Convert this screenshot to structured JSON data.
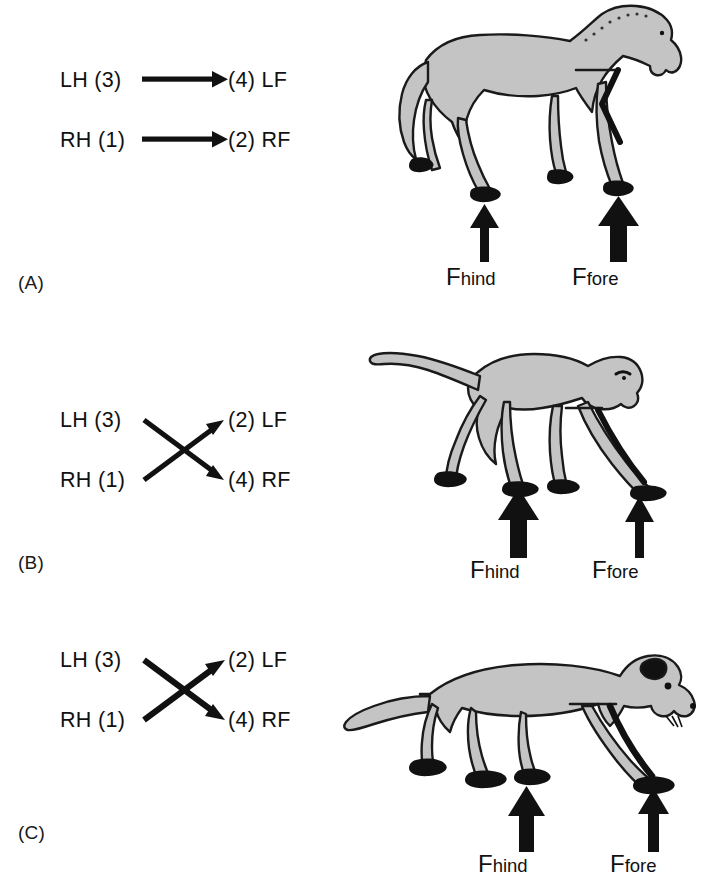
{
  "figure": {
    "background": "#ffffff",
    "ink": "#111111",
    "body_fill": "#c4c4c4",
    "body_stroke": "#1a1a1a",
    "hoof_fill": "#111111"
  },
  "panels": [
    {
      "letter": "(A)",
      "animal": "horse",
      "pattern": "parallel",
      "diagram": {
        "rows": [
          {
            "from": "LH (3)",
            "to": "(4) LF"
          },
          {
            "from": "RH (1)",
            "to": "(2) RF"
          }
        ]
      },
      "forces": [
        {
          "name": "F",
          "subscript": "hind",
          "weight": "light"
        },
        {
          "name": "F",
          "subscript": "fore",
          "weight": "heavy"
        }
      ]
    },
    {
      "letter": "(B)",
      "animal": "monkey",
      "pattern": "crossed",
      "diagram": {
        "rows": [
          {
            "from": "LH (3)",
            "to": "(2) LF"
          },
          {
            "from": "RH (1)",
            "to": "(4) RF"
          }
        ]
      },
      "forces": [
        {
          "name": "F",
          "subscript": "hind",
          "weight": "heavy"
        },
        {
          "name": "F",
          "subscript": "fore",
          "weight": "light"
        }
      ]
    },
    {
      "letter": "(C)",
      "animal": "opossum",
      "pattern": "crossed",
      "diagram": {
        "rows": [
          {
            "from": "LH (3)",
            "to": "(2) LF"
          },
          {
            "from": "RH (1)",
            "to": "(4) RF"
          }
        ]
      },
      "forces": [
        {
          "name": "F",
          "subscript": "hind",
          "weight": "heavy"
        },
        {
          "name": "F",
          "subscript": "fore",
          "weight": "light"
        }
      ]
    }
  ]
}
